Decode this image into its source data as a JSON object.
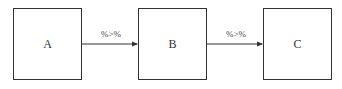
{
  "diagram": {
    "nodes": [
      {
        "id": "A",
        "label": "A"
      },
      {
        "id": "B",
        "label": "B"
      },
      {
        "id": "C",
        "label": "C"
      }
    ],
    "edges": [
      {
        "from": "A",
        "to": "B",
        "label": "%>%"
      },
      {
        "from": "B",
        "to": "C",
        "label": "%>%"
      }
    ],
    "colors": {
      "stroke": "#333333",
      "background": "#ffffff"
    }
  }
}
